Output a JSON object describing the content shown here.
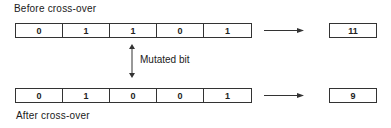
{
  "diagram": {
    "before_label": "Before cross-over",
    "after_label": "After cross-over",
    "mutation_label": "Mutated bit",
    "before": {
      "bits": [
        "0",
        "1",
        "1",
        "0",
        "1"
      ],
      "decimal": "11"
    },
    "after": {
      "bits": [
        "0",
        "1",
        "0",
        "0",
        "1"
      ],
      "decimal": "9"
    },
    "mutated_bit_index": 2,
    "icons": {
      "row_arrow": "right-arrow-icon",
      "mutation_arrow": "double-vertical-arrow-icon"
    }
  }
}
